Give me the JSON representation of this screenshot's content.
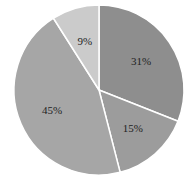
{
  "chart_data": {
    "type": "pie",
    "title": "",
    "start_angle_deg": 0,
    "direction": "clockwise",
    "slices": [
      {
        "label": "31%",
        "value": 31,
        "color": "#8e8e8e"
      },
      {
        "label": "15%",
        "value": 15,
        "color": "#9c9c9c"
      },
      {
        "label": "45%",
        "value": 45,
        "color": "#a6a6a6"
      },
      {
        "label": "9%",
        "value": 9,
        "color": "#cbcbcb"
      }
    ],
    "legend": "none",
    "separator_color": "#ffffff"
  },
  "geometry": {
    "cx": 99,
    "cy": 90,
    "r": 85,
    "label_r": 0.6
  }
}
